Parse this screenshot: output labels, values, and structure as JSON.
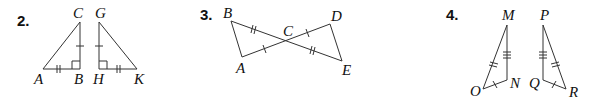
{
  "problems": [
    {
      "number": "2.",
      "labels": {
        "C": "C",
        "G": "G",
        "A": "A",
        "B": "B",
        "H": "H",
        "K": "K"
      },
      "description": "Two right triangles ABC and HGK with right angles at B and H; AB ≅ HK (double tick), BC ≅ GH (single tick)"
    },
    {
      "number": "3.",
      "labels": {
        "B": "B",
        "C": "C",
        "D": "D",
        "A": "A",
        "E": "E"
      },
      "description": "Segments BE and AD intersect at C; BC ≅ CE (double tick), AC ≅ CD (single tick)"
    },
    {
      "number": "4.",
      "labels": {
        "M": "M",
        "P": "P",
        "O": "O",
        "N": "N",
        "Q": "Q",
        "R": "R"
      },
      "description": "Triangles MNO and PQR; MN ≅ PQ (triple tick), MO ≅ PR (double tick), ON ≅ QR (single tick)"
    }
  ]
}
